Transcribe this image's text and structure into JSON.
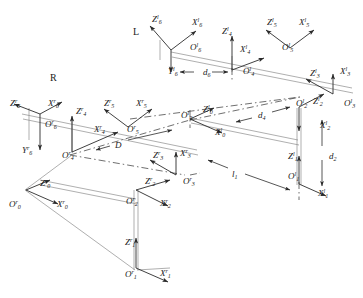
{
  "figure": {
    "type": "kinematic-frame-diagram",
    "side_markers": [
      {
        "name": "left-arm-marker",
        "text": "L",
        "x": 133,
        "y": 26
      },
      {
        "name": "right-arm-marker",
        "text": "R",
        "x": 50,
        "y": 72
      }
    ],
    "dimension_labels": [
      {
        "name": "d6",
        "base": "d",
        "sub": "6",
        "sup": "",
        "x": 203,
        "y": 68
      },
      {
        "name": "d4",
        "base": "d",
        "sub": "4",
        "sup": "",
        "x": 258,
        "y": 111
      },
      {
        "name": "d2",
        "base": "d",
        "sub": "2",
        "sup": "",
        "x": 329,
        "y": 152
      },
      {
        "name": "l1",
        "base": "l",
        "sub": "1",
        "sup": "",
        "x": 232,
        "y": 170
      },
      {
        "name": "D",
        "base": "D",
        "sub": "",
        "sup": "",
        "x": 115,
        "y": 141
      }
    ],
    "frame_labels": [
      {
        "name": "label-Z6-left",
        "base": "Z",
        "sub": "6",
        "sup": "l",
        "x": 152,
        "y": 14
      },
      {
        "name": "label-X6-left",
        "base": "X",
        "sub": "6",
        "sup": "l",
        "x": 192,
        "y": 17
      },
      {
        "name": "label-O6-left",
        "base": "O",
        "sub": "6",
        "sup": "l",
        "x": 190,
        "y": 42
      },
      {
        "name": "label-Y6-left",
        "base": "Y",
        "sub": "6",
        "sup": "l",
        "x": 168,
        "y": 66
      },
      {
        "name": "label-Z4-left",
        "base": "Z",
        "sub": "4",
        "sup": "l",
        "x": 222,
        "y": 26
      },
      {
        "name": "label-X4-left",
        "base": "X",
        "sub": "4",
        "sup": "l",
        "x": 240,
        "y": 44
      },
      {
        "name": "label-O4-left",
        "base": "O",
        "sub": "4",
        "sup": "l",
        "x": 243,
        "y": 66
      },
      {
        "name": "label-Z5-left",
        "base": "Z",
        "sub": "5",
        "sup": "l",
        "x": 267,
        "y": 17
      },
      {
        "name": "label-X5-left",
        "base": "X",
        "sub": "5",
        "sup": "l",
        "x": 299,
        "y": 17
      },
      {
        "name": "label-O5-left",
        "base": "O",
        "sub": "5",
        "sup": "l",
        "x": 282,
        "y": 42
      },
      {
        "name": "label-Z3-left",
        "base": "Z",
        "sub": "3",
        "sup": "l",
        "x": 310,
        "y": 68
      },
      {
        "name": "label-X3-left",
        "base": "X",
        "sub": "3",
        "sup": "l",
        "x": 340,
        "y": 66
      },
      {
        "name": "label-O3-left",
        "base": "O",
        "sub": "3",
        "sup": "l",
        "x": 344,
        "y": 98
      },
      {
        "name": "label-O2-left",
        "base": "O",
        "sub": "2",
        "sup": "l",
        "x": 296,
        "y": 98
      },
      {
        "name": "label-Z2-left",
        "base": "Z",
        "sub": "2",
        "sup": "l",
        "x": 313,
        "y": 96
      },
      {
        "name": "label-X2-left",
        "base": "X",
        "sub": "2",
        "sup": "l",
        "x": 320,
        "y": 120
      },
      {
        "name": "label-Z1-left",
        "base": "Z",
        "sub": "1",
        "sup": "l",
        "x": 288,
        "y": 151
      },
      {
        "name": "label-O1-left",
        "base": "O",
        "sub": "1",
        "sup": "l",
        "x": 288,
        "y": 171
      },
      {
        "name": "label-X1-left",
        "base": "X",
        "sub": "1",
        "sup": "l",
        "x": 318,
        "y": 188
      },
      {
        "name": "label-O0-left",
        "base": "O",
        "sub": "0",
        "sup": "l",
        "x": 181,
        "y": 110
      },
      {
        "name": "label-Z0-left",
        "base": "Z",
        "sub": "0",
        "sup": "l",
        "x": 203,
        "y": 104
      },
      {
        "name": "label-X0-left",
        "base": "X",
        "sub": "0",
        "sup": "l",
        "x": 215,
        "y": 127
      },
      {
        "name": "label-Z6-right",
        "base": "Z",
        "sub": "6",
        "sup": "r",
        "x": 10,
        "y": 98
      },
      {
        "name": "label-X6-right",
        "base": "X",
        "sub": "6",
        "sup": "r",
        "x": 48,
        "y": 98
      },
      {
        "name": "label-O6-right",
        "base": "O",
        "sub": "6",
        "sup": "r",
        "x": 45,
        "y": 119
      },
      {
        "name": "label-Y6-right",
        "base": "Y",
        "sub": "6",
        "sup": "r",
        "x": 22,
        "y": 145
      },
      {
        "name": "label-Z4-right",
        "base": "Z",
        "sub": "4",
        "sup": "r",
        "x": 76,
        "y": 106
      },
      {
        "name": "label-X4-right",
        "base": "X",
        "sub": "4",
        "sup": "r",
        "x": 94,
        "y": 124
      },
      {
        "name": "label-O4-right",
        "base": "O",
        "sub": "4",
        "sup": "r",
        "x": 62,
        "y": 150
      },
      {
        "name": "label-Z5-right",
        "base": "Z",
        "sub": "5",
        "sup": "r",
        "x": 104,
        "y": 98
      },
      {
        "name": "label-X5-right",
        "base": "X",
        "sub": "5",
        "sup": "r",
        "x": 136,
        "y": 98
      },
      {
        "name": "label-O5-right",
        "base": "O",
        "sub": "5",
        "sup": "r",
        "x": 127,
        "y": 124
      },
      {
        "name": "label-Z3-right",
        "base": "Z",
        "sub": "3",
        "sup": "r",
        "x": 153,
        "y": 150
      },
      {
        "name": "label-X3-right",
        "base": "X",
        "sub": "3",
        "sup": "r",
        "x": 180,
        "y": 148
      },
      {
        "name": "label-O3-right",
        "base": "O",
        "sub": "3",
        "sup": "r",
        "x": 183,
        "y": 176
      },
      {
        "name": "label-Z2-right",
        "base": "Z",
        "sub": "2",
        "sup": "r",
        "x": 145,
        "y": 176
      },
      {
        "name": "label-O2-right",
        "base": "O",
        "sub": "2",
        "sup": "r",
        "x": 126,
        "y": 196
      },
      {
        "name": "label-X2-right",
        "base": "X",
        "sub": "2",
        "sup": "r",
        "x": 160,
        "y": 198
      },
      {
        "name": "label-Z1-right",
        "base": "Z",
        "sub": "1",
        "sup": "r",
        "x": 125,
        "y": 237
      },
      {
        "name": "label-O1-right",
        "base": "O",
        "sub": "1",
        "sup": "r",
        "x": 125,
        "y": 269
      },
      {
        "name": "label-X1-right",
        "base": "X",
        "sub": "1",
        "sup": "r",
        "x": 160,
        "y": 268
      },
      {
        "name": "label-O0-right",
        "base": "O",
        "sub": "0",
        "sup": "r",
        "x": 9,
        "y": 199
      },
      {
        "name": "label-Z0-right",
        "base": "Z",
        "sub": "0",
        "sup": "r",
        "x": 40,
        "y": 178
      },
      {
        "name": "label-X0-right",
        "base": "X",
        "sub": "0",
        "sup": "r",
        "x": 57,
        "y": 199
      }
    ],
    "colors": {
      "stroke": "#2b2b2b",
      "faint": "#9a9a9a",
      "background": "#ffffff"
    }
  }
}
